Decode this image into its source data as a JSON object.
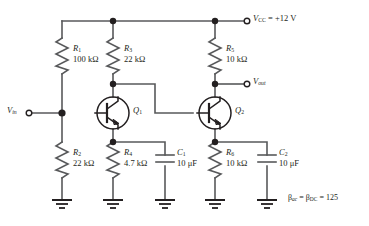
{
  "figure": {
    "type": "schematic",
    "background_color": "#ffffff",
    "wire_color": "#58595b",
    "ink_color": "#231f20"
  },
  "terminals": [
    {
      "id": "vcc",
      "symbol": "V",
      "subscript": "CC",
      "equals": " = +12 V",
      "x": 245,
      "y": 21
    },
    {
      "id": "vout",
      "symbol": "V",
      "subscript": "out",
      "equals": "",
      "x": 245,
      "y": 84
    },
    {
      "id": "vin",
      "symbol": "V",
      "subscript": "in",
      "equals": "",
      "x": 18,
      "y": 108
    }
  ],
  "components": {
    "resistors": [
      {
        "ref": "R",
        "index": "1",
        "value": "100 kΩ",
        "x": 62,
        "y": 56
      },
      {
        "ref": "R",
        "index": "2",
        "value": "22 kΩ",
        "x": 62,
        "y": 160
      },
      {
        "ref": "R",
        "index": "3",
        "value": "22 kΩ",
        "x": 113,
        "y": 56
      },
      {
        "ref": "R",
        "index": "4",
        "value": "4.7 kΩ",
        "x": 113,
        "y": 160
      },
      {
        "ref": "R",
        "index": "5",
        "value": "10 kΩ",
        "x": 215,
        "y": 56
      },
      {
        "ref": "R",
        "index": "6",
        "value": "10 kΩ",
        "x": 215,
        "y": 160
      }
    ],
    "capacitors": [
      {
        "ref": "C",
        "index": "1",
        "value": "10 μF",
        "x": 165,
        "y": 160
      },
      {
        "ref": "C",
        "index": "2",
        "value": "10 μF",
        "x": 267,
        "y": 160
      }
    ],
    "transistors": [
      {
        "ref": "Q",
        "index": "1",
        "kind": "npn",
        "x": 113,
        "y": 113
      },
      {
        "ref": "Q",
        "index": "2",
        "kind": "npn",
        "x": 215,
        "y": 113
      }
    ],
    "grounds": [
      {
        "x": 62
      },
      {
        "x": 113
      },
      {
        "x": 165
      },
      {
        "x": 215
      },
      {
        "x": 267
      }
    ]
  },
  "annotation": {
    "beta_text_1": "β",
    "beta_sub_1": "ac",
    "beta_mid": " = ",
    "beta_text_2": "β",
    "beta_sub_2": "DC",
    "beta_value": " = 125",
    "full": "βac = βDC = 125"
  },
  "labels": {
    "r1_ref": "R",
    "r1_sub": "1",
    "r1_val": "100 kΩ",
    "r2_ref": "R",
    "r2_sub": "2",
    "r2_val": "22 kΩ",
    "r3_ref": "R",
    "r3_sub": "3",
    "r3_val": "22 kΩ",
    "r4_ref": "R",
    "r4_sub": "4",
    "r4_val": "4.7 kΩ",
    "r5_ref": "R",
    "r5_sub": "5",
    "r5_val": "10 kΩ",
    "r6_ref": "R",
    "r6_sub": "6",
    "r6_val": "10 kΩ",
    "c1_ref": "C",
    "c1_sub": "1",
    "c1_val": "10 μF",
    "c2_ref": "C",
    "c2_sub": "2",
    "c2_val": "10 μF",
    "q1_ref": "Q",
    "q1_sub": "1",
    "q2_ref": "Q",
    "q2_sub": "2",
    "vcc_sym": "V",
    "vcc_sub": "CC",
    "vcc_val": " = +12 V",
    "vout_sym": "V",
    "vout_sub": "out",
    "vin_sym": "V",
    "vin_sub": "in"
  }
}
